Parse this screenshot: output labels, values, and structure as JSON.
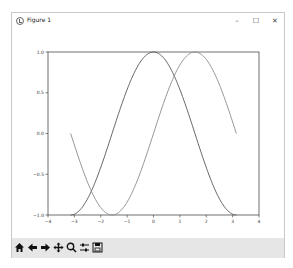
{
  "window": {
    "title": "Figure 1",
    "controls": {
      "minimize": "–",
      "maximize": "☐",
      "close": "✕"
    }
  },
  "toolbar": {
    "buttons": [
      {
        "name": "home",
        "icon": "home-icon"
      },
      {
        "name": "back",
        "icon": "arrow-left-icon"
      },
      {
        "name": "forward",
        "icon": "arrow-right-icon"
      },
      {
        "name": "pan",
        "icon": "move-icon"
      },
      {
        "name": "zoom",
        "icon": "magnifier-icon"
      },
      {
        "name": "configure-subplots",
        "icon": "sliders-icon"
      },
      {
        "name": "save",
        "icon": "floppy-icon"
      }
    ]
  },
  "chart_data": {
    "type": "line",
    "title": "",
    "xlabel": "",
    "ylabel": "",
    "xlim": [
      -4,
      4
    ],
    "ylim": [
      -1.0,
      1.0
    ],
    "xticks": [
      -4,
      -3,
      -2,
      -1,
      0,
      1,
      2,
      3,
      4
    ],
    "xtick_labels": [
      "−4",
      "−3",
      "−2",
      "−1",
      "0",
      "1",
      "2",
      "3",
      "4"
    ],
    "yticks": [
      -1.0,
      -0.5,
      0.0,
      0.5,
      1.0
    ],
    "ytick_labels": [
      "−1.0",
      "−0.5",
      "0.0",
      "0.5",
      "1.0"
    ],
    "grid": false,
    "legend": null,
    "x_range": [
      -3.1416,
      3.1416
    ],
    "series": [
      {
        "name": "cos(x)",
        "color": "#555555",
        "x": [
          -3.1416,
          -2.618,
          -2.0944,
          -1.5708,
          -1.0472,
          -0.5236,
          0,
          0.5236,
          1.0472,
          1.5708,
          2.0944,
          2.618,
          3.1416
        ],
        "values": [
          -1.0,
          -0.866,
          -0.5,
          0.0,
          0.5,
          0.866,
          1.0,
          0.866,
          0.5,
          0.0,
          -0.5,
          -0.866,
          -1.0
        ]
      },
      {
        "name": "sin(x)",
        "color": "#8a8a8a",
        "x": [
          -3.1416,
          -2.618,
          -2.0944,
          -1.5708,
          -1.0472,
          -0.5236,
          0,
          0.5236,
          1.0472,
          1.5708,
          2.0944,
          2.618,
          3.1416
        ],
        "values": [
          0.0,
          -0.5,
          -0.866,
          -1.0,
          -0.866,
          -0.5,
          0.0,
          0.5,
          0.866,
          1.0,
          0.866,
          0.5,
          0.0
        ]
      }
    ]
  }
}
